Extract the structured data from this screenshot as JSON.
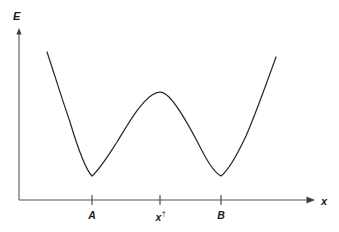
{
  "figure": {
    "background_color": "#ffffff",
    "stroke_color": "#2b2b2b",
    "axis_color": "#555555",
    "width": 339,
    "height": 232
  },
  "axes": {
    "y_label": "E",
    "x_label": "x",
    "origin": {
      "x": 19,
      "y": 200
    },
    "y_top": 30,
    "x_right": 315
  },
  "ticks": [
    {
      "name": "A",
      "label": "A",
      "x": 92,
      "has_dagger": false
    },
    {
      "name": "x-dagger",
      "label": "x",
      "dagger": "†",
      "x": 160,
      "has_dagger": true
    },
    {
      "name": "B",
      "label": "B",
      "x": 221,
      "has_dagger": false
    }
  ],
  "chart_data": {
    "type": "line",
    "title": "",
    "xlabel": "x",
    "ylabel": "E",
    "grid": false,
    "legend": null,
    "annotations": [
      {
        "text": "A",
        "meaning": "left local minimum (reactant well)",
        "x_px": 92,
        "y_px": 176
      },
      {
        "text": "x†",
        "meaning": "transition state / barrier maximum",
        "x_px": 160,
        "y_px": 92
      },
      {
        "text": "B",
        "meaning": "right local minimum (product well)",
        "x_px": 221,
        "y_px": 176
      }
    ],
    "axis_ranges": {
      "x_px": [
        19,
        315
      ],
      "y_px": [
        200,
        30
      ]
    },
    "curve_points_px": [
      {
        "x": 47,
        "y": 52
      },
      {
        "x": 52,
        "y": 66
      },
      {
        "x": 58,
        "y": 83
      },
      {
        "x": 64,
        "y": 101
      },
      {
        "x": 70,
        "y": 120
      },
      {
        "x": 76,
        "y": 139
      },
      {
        "x": 82,
        "y": 157
      },
      {
        "x": 87,
        "y": 168
      },
      {
        "x": 92,
        "y": 176
      },
      {
        "x": 98,
        "y": 173
      },
      {
        "x": 104,
        "y": 165
      },
      {
        "x": 111,
        "y": 153
      },
      {
        "x": 119,
        "y": 139
      },
      {
        "x": 128,
        "y": 124
      },
      {
        "x": 137,
        "y": 111
      },
      {
        "x": 145,
        "y": 101
      },
      {
        "x": 152,
        "y": 95
      },
      {
        "x": 160,
        "y": 92
      },
      {
        "x": 168,
        "y": 95
      },
      {
        "x": 176,
        "y": 102
      },
      {
        "x": 184,
        "y": 114
      },
      {
        "x": 193,
        "y": 131
      },
      {
        "x": 201,
        "y": 148
      },
      {
        "x": 209,
        "y": 163
      },
      {
        "x": 215,
        "y": 172
      },
      {
        "x": 221,
        "y": 176
      },
      {
        "x": 228,
        "y": 172
      },
      {
        "x": 236,
        "y": 158
      },
      {
        "x": 244,
        "y": 141
      },
      {
        "x": 252,
        "y": 121
      },
      {
        "x": 260,
        "y": 100
      },
      {
        "x": 268,
        "y": 78
      },
      {
        "x": 276,
        "y": 57
      }
    ],
    "curve_path": "M 47,52 C 54,73 62,99 70,122 C 76,142 84,168 92,176 C 100,169 108,156 117,142 C 128,124 140,103 152,95 C 155,93 158,92 160,92 C 163,92 166,94 169,97 C 178,106 188,124 197,141 C 205,157 213,172 221,176 C 229,170 238,153 246,136 C 256,113 266,85 276,57"
  }
}
